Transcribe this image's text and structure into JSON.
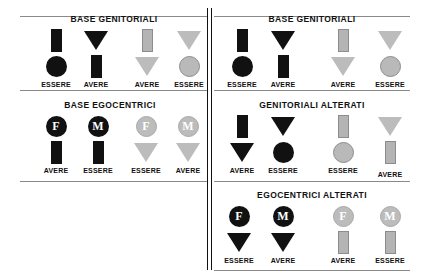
{
  "figure": {
    "panels": [
      {
        "id": "top-left",
        "title": "BASE  GENITORIALI",
        "columns": [
          {
            "label": "ESSERE",
            "top": "rect-black",
            "bottom": "circle-black"
          },
          {
            "label": "AVERE",
            "top": "triangle-black",
            "bottom": "rect-black"
          },
          {
            "label": "AVERE",
            "top": "rect-gray",
            "bottom": "triangle-gray"
          },
          {
            "label": "ESSERE",
            "top": "triangle-gray",
            "bottom": "circle-gray"
          }
        ]
      },
      {
        "id": "top-right",
        "title": "BASE  GENITORIALI",
        "columns": [
          {
            "label": "ESSERE",
            "top": "rect-black",
            "bottom": "circle-black"
          },
          {
            "label": "AVERE",
            "top": "triangle-black",
            "bottom": "rect-black"
          },
          {
            "label": "AVERE",
            "top": "rect-gray",
            "bottom": "triangle-gray"
          },
          {
            "label": "ESSERE",
            "top": "triangle-gray",
            "bottom": "circle-gray"
          }
        ]
      },
      {
        "id": "middle-left",
        "title": "BASE  EGOCENTRICI",
        "columns": [
          {
            "label": "AVERE",
            "top": "badge-F-black",
            "bottom": "rect-black"
          },
          {
            "label": "ESSERE",
            "top": "badge-M-black",
            "bottom": "rect-black"
          },
          {
            "label": "ESSERE",
            "top": "badge-F-gray",
            "bottom": "triangle-gray"
          },
          {
            "label": "AVERE",
            "top": "badge-M-gray",
            "bottom": "triangle-gray"
          }
        ]
      },
      {
        "id": "middle-right",
        "title": "GENITORIALI  ALTERATI",
        "columns": [
          {
            "label": "AVERE",
            "top": "rect-black",
            "bottom": "triangle-black"
          },
          {
            "label": "ESSERE",
            "top": "triangle-black",
            "bottom": "circle-black"
          },
          {
            "label": "ESSERE",
            "top": "rect-gray",
            "bottom": "circle-gray"
          },
          {
            "label": "AVERE",
            "top": "triangle-gray",
            "bottom": "rect-gray"
          }
        ]
      },
      {
        "id": "bottom-right",
        "title": "EGOCENTRICI  ALTERATI",
        "columns": [
          {
            "label": "ESSERE",
            "top": "badge-F-black",
            "bottom": "triangle-black"
          },
          {
            "label": "AVERE",
            "top": "badge-M-black",
            "bottom": "triangle-black"
          },
          {
            "label": "AVERE",
            "top": "badge-F-gray",
            "bottom": "rect-gray"
          },
          {
            "label": "ESSERE",
            "top": "badge-M-gray",
            "bottom": "rect-gray"
          }
        ]
      },
      {
        "id": "bottom-left",
        "title": "",
        "columns": []
      }
    ],
    "badge_letters": {
      "female": "F",
      "male": "M"
    },
    "colors": {
      "black": "#111111",
      "gray": "#b9b9b9",
      "rule": "#8a8a8a"
    }
  }
}
